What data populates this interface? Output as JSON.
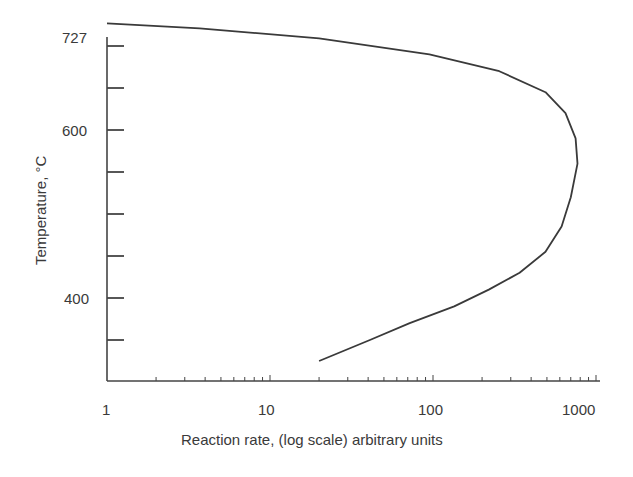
{
  "chart_data": {
    "type": "line",
    "title": "",
    "xlabel": "Reaction rate, (log scale) arbitrary units",
    "ylabel": "Temperature, °C",
    "xscale": "log",
    "xlim": [
      1,
      1200
    ],
    "ylim": [
      300,
      727
    ],
    "grid": false,
    "legend": null,
    "x_tick_labels": [
      "1",
      "10",
      "100",
      "1000"
    ],
    "y_tick_labels": [
      "727",
      "600",
      "400"
    ],
    "y_minor_ticks": [
      350,
      400,
      450,
      500,
      550,
      600,
      650,
      700
    ],
    "series": [
      {
        "name": "Reaction rate vs temperature",
        "x": [
          1,
          3.7,
          20,
          95,
          255,
          490,
          650,
          750,
          770,
          700,
          615,
          490,
          340,
          220,
          135,
          72,
          41,
          20
        ],
        "y": [
          727,
          721,
          709,
          690,
          670,
          645,
          620,
          590,
          560,
          520,
          485,
          455,
          430,
          410,
          390,
          370,
          350,
          325
        ]
      }
    ]
  },
  "axes": {
    "x_title": "Reaction rate, (log scale) arbitrary units",
    "y_title": "Temperature, °C",
    "x_ticks": [
      {
        "label": "1",
        "value": 1
      },
      {
        "label": "10",
        "value": 10
      },
      {
        "label": "100",
        "value": 100
      },
      {
        "label": "1000",
        "value": 1000
      }
    ],
    "y_ticks": [
      {
        "label": "727",
        "value": 727
      },
      {
        "label": "600",
        "value": 600
      },
      {
        "label": "400",
        "value": 400
      }
    ]
  },
  "colors": {
    "line": "#3a3a3a",
    "axis": "#444444",
    "background": "#ffffff"
  }
}
